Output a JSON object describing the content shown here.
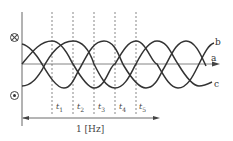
{
  "diagram": {
    "title": "",
    "symbols": {
      "into_page": "⊗",
      "out_of_page": "⊙"
    },
    "curves": [
      {
        "label": "a",
        "type": "axis-line"
      },
      {
        "label": "b",
        "type": "sine",
        "phase": "rising-end"
      },
      {
        "label": "c",
        "type": "sine",
        "phase": "falling-end"
      }
    ],
    "time_markers": [
      {
        "label": "t",
        "sub": "1"
      },
      {
        "label": "t",
        "sub": "2"
      },
      {
        "label": "t",
        "sub": "3"
      },
      {
        "label": "t",
        "sub": "4"
      },
      {
        "label": "t",
        "sub": "5"
      }
    ],
    "period_label": "1 [Hz]",
    "colors": {
      "line": "#333333",
      "dashed": "#555555",
      "axis": "#666666"
    }
  }
}
